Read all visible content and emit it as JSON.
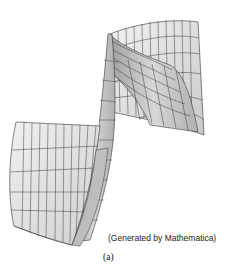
{
  "figure": {
    "credit": "(Generated by Mathematica)",
    "sublabel": "(a)",
    "colors": {
      "surface_light": "#eeeeee",
      "surface_mid": "#d6d6d6",
      "surface_dark": "#a8a8a8",
      "mesh": "#3a3a3a",
      "background": "#ffffff"
    }
  }
}
